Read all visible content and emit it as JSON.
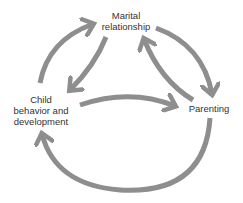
{
  "diagram": {
    "nodes": [
      {
        "id": "marital",
        "line1": "Marital",
        "line2": "relationship"
      },
      {
        "id": "child",
        "line1": "Child",
        "line2": "behavior and",
        "line3": "development"
      },
      {
        "id": "parenting",
        "line1": "Parenting"
      }
    ],
    "edges": [
      {
        "from": "child",
        "to": "marital",
        "style": "outer-arc"
      },
      {
        "from": "marital",
        "to": "child",
        "style": "inner"
      },
      {
        "from": "marital",
        "to": "parenting",
        "style": "outer-arc"
      },
      {
        "from": "parenting",
        "to": "marital",
        "style": "inner"
      },
      {
        "from": "child",
        "to": "parenting",
        "style": "middle"
      },
      {
        "from": "parenting",
        "to": "child",
        "style": "bottom-arc"
      }
    ],
    "colors": {
      "arrow": "#8e8e8e",
      "text": "#333333",
      "background": "#ffffff"
    }
  }
}
